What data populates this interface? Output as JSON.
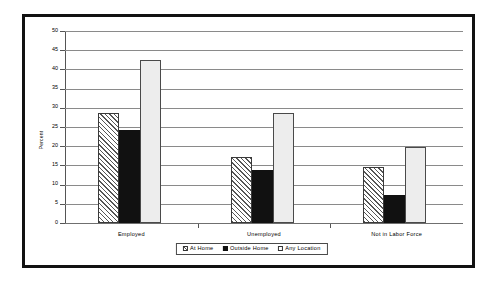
{
  "chart_data": {
    "type": "bar",
    "title": "",
    "xlabel": "",
    "ylabel": "Percent",
    "ylim": [
      0,
      50
    ],
    "yticks": [
      0,
      5,
      10,
      15,
      20,
      25,
      30,
      35,
      40,
      45,
      50
    ],
    "ytick_labels": [
      "0",
      "5",
      "10",
      "15",
      "20",
      "25",
      "30",
      "35",
      "40",
      "45",
      "50"
    ],
    "grid": true,
    "legend_position": "bottom",
    "categories": [
      "Employed",
      "Unemployed",
      "Not in Labor Force"
    ],
    "series": [
      {
        "name": "At Home",
        "fill": "diagonal-hatch",
        "color": "#f2f2f2",
        "values": [
          28.6,
          17.2,
          14.6
        ]
      },
      {
        "name": "Outside Home",
        "fill": "solid",
        "color": "#111111",
        "values": [
          24.2,
          13.8,
          7.3
        ]
      },
      {
        "name": "Any Location",
        "fill": "solid",
        "color": "#ededed",
        "values": [
          42.5,
          28.6,
          19.9
        ]
      }
    ]
  },
  "legend": {
    "items": [
      {
        "label": "At Home"
      },
      {
        "label": "Outside Home"
      },
      {
        "label": "Any Location"
      }
    ]
  },
  "colors": {
    "frame": "#111111",
    "gridline": "#8a8a8a",
    "axis": "#555555",
    "background": "#ffffff"
  }
}
